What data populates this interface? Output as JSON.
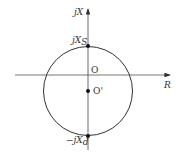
{
  "diagram": {
    "axes": {
      "vertical_label": "jX",
      "horizontal_label": "R"
    },
    "points": {
      "top": {
        "label": "jX",
        "sub": "S"
      },
      "origin": {
        "label": "O"
      },
      "center": {
        "label": "O'"
      },
      "bottom": {
        "label": "−jX",
        "sub": "d"
      }
    },
    "colors": {
      "line": "#333333",
      "axis": "#555555"
    }
  }
}
